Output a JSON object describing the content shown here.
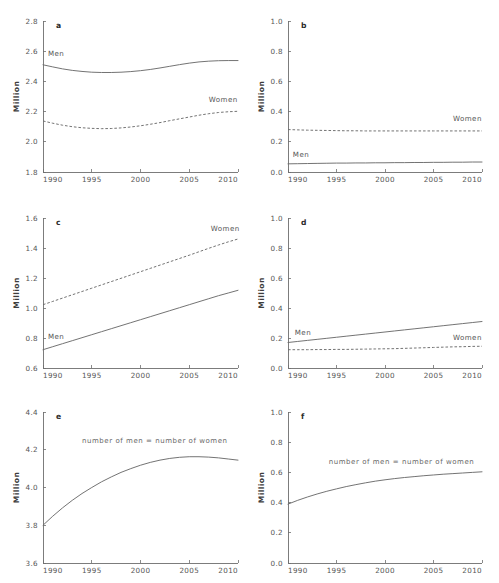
{
  "figure": {
    "width": 499,
    "height": 583,
    "background": "#ffffff",
    "line_color": "#6b6b6b",
    "text_color": "#555555",
    "panel_count": 6,
    "rows": 3,
    "cols": 2
  },
  "common": {
    "ylabel": "Million",
    "xticks": [
      "1990",
      "1995",
      "2000",
      "2005",
      "2010"
    ],
    "xlim": [
      1990,
      2010
    ],
    "men_label": "Men",
    "women_label": "Women",
    "equal_label": "number of men = number of women"
  },
  "chart_data": [
    {
      "type": "line",
      "panel": "a",
      "title": "",
      "xlabel": "",
      "ylabel": "Million",
      "xlim": [
        1990,
        2010
      ],
      "ylim": [
        1.8,
        2.8
      ],
      "yticks": [
        "1.8",
        "2.0",
        "2.2",
        "2.4",
        "2.6",
        "2.8"
      ],
      "ytick_values": [
        1.8,
        2.0,
        2.2,
        2.4,
        2.6,
        2.8
      ],
      "xticks": [
        "1990",
        "1995",
        "2000",
        "2005",
        "2010"
      ],
      "grid": false,
      "legend_position": "inline-annotation",
      "x": [
        1990,
        1991,
        1992,
        1993,
        1994,
        1995,
        1996,
        1997,
        1998,
        1999,
        2000,
        2001,
        2002,
        2003,
        2004,
        2005,
        2006,
        2007,
        2008,
        2009,
        2010
      ],
      "series": [
        {
          "name": "Men",
          "style": "solid",
          "label_x": 1990.5,
          "label_y": 2.57,
          "values": [
            2.51,
            2.496,
            2.483,
            2.473,
            2.466,
            2.461,
            2.459,
            2.459,
            2.461,
            2.465,
            2.471,
            2.479,
            2.489,
            2.5,
            2.511,
            2.521,
            2.529,
            2.534,
            2.537,
            2.538,
            2.538
          ]
        },
        {
          "name": "Women",
          "style": "dashed",
          "label_x": 2007.0,
          "label_y": 2.265,
          "values": [
            2.138,
            2.123,
            2.11,
            2.1,
            2.093,
            2.089,
            2.087,
            2.088,
            2.092,
            2.098,
            2.106,
            2.116,
            2.127,
            2.14,
            2.152,
            2.164,
            2.176,
            2.186,
            2.194,
            2.199,
            2.202
          ]
        }
      ]
    },
    {
      "type": "line",
      "panel": "b",
      "title": "",
      "xlabel": "",
      "ylabel": "Million",
      "xlim": [
        1990,
        2010
      ],
      "ylim": [
        0.0,
        1.0
      ],
      "yticks": [
        "0.0",
        "0.2",
        "0.4",
        "0.6",
        "0.8",
        "1.0"
      ],
      "ytick_values": [
        0.0,
        0.2,
        0.4,
        0.6,
        0.8,
        1.0
      ],
      "xticks": [
        "1990",
        "1995",
        "2000",
        "2005",
        "2010"
      ],
      "grid": false,
      "legend_position": "inline-annotation",
      "x": [
        1990,
        1991,
        1992,
        1993,
        1994,
        1995,
        1996,
        1997,
        1998,
        1999,
        2000,
        2001,
        2002,
        2003,
        2004,
        2005,
        2006,
        2007,
        2008,
        2009,
        2010
      ],
      "series": [
        {
          "name": "Women",
          "style": "dashed",
          "label_x": 2007.0,
          "label_y": 0.335,
          "values": [
            0.281,
            0.279,
            0.277,
            0.276,
            0.275,
            0.274,
            0.273,
            0.273,
            0.272,
            0.272,
            0.272,
            0.272,
            0.272,
            0.272,
            0.272,
            0.272,
            0.272,
            0.272,
            0.272,
            0.272,
            0.272
          ]
        },
        {
          "name": "Men",
          "style": "solid",
          "label_x": 1990.5,
          "label_y": 0.098,
          "values": [
            0.054,
            0.055,
            0.056,
            0.057,
            0.058,
            0.059,
            0.059,
            0.06,
            0.06,
            0.061,
            0.061,
            0.062,
            0.062,
            0.063,
            0.063,
            0.064,
            0.064,
            0.065,
            0.065,
            0.066,
            0.066
          ]
        }
      ]
    },
    {
      "type": "line",
      "panel": "c",
      "title": "",
      "xlabel": "",
      "ylabel": "Million",
      "xlim": [
        1990,
        2010
      ],
      "ylim": [
        0.6,
        1.6
      ],
      "yticks": [
        "0.6",
        "0.8",
        "1.0",
        "1.2",
        "1.4",
        "1.6"
      ],
      "ytick_values": [
        0.6,
        0.8,
        1.0,
        1.2,
        1.4,
        1.6
      ],
      "xticks": [
        "1990",
        "1995",
        "2000",
        "2005",
        "2010"
      ],
      "grid": false,
      "legend_position": "inline-annotation",
      "x": [
        1990,
        1991,
        1992,
        1993,
        1994,
        1995,
        1996,
        1997,
        1998,
        1999,
        2000,
        2001,
        2002,
        2003,
        2004,
        2005,
        2006,
        2007,
        2008,
        2009,
        2010
      ],
      "series": [
        {
          "name": "Women",
          "style": "dashed",
          "label_x": 2007.2,
          "label_y": 1.515,
          "values": [
            1.022,
            1.044,
            1.066,
            1.088,
            1.11,
            1.132,
            1.154,
            1.176,
            1.198,
            1.22,
            1.242,
            1.264,
            1.286,
            1.308,
            1.33,
            1.352,
            1.375,
            1.398,
            1.42,
            1.441,
            1.46
          ]
        },
        {
          "name": "Men",
          "style": "solid",
          "label_x": 1990.5,
          "label_y": 0.795,
          "values": [
            0.722,
            0.742,
            0.762,
            0.782,
            0.802,
            0.822,
            0.842,
            0.862,
            0.882,
            0.902,
            0.922,
            0.942,
            0.962,
            0.982,
            1.002,
            1.022,
            1.042,
            1.062,
            1.082,
            1.1,
            1.118
          ]
        }
      ]
    },
    {
      "type": "line",
      "panel": "d",
      "title": "",
      "xlabel": "",
      "ylabel": "Million",
      "xlim": [
        1990,
        2010
      ],
      "ylim": [
        0.0,
        1.0
      ],
      "yticks": [
        "0.0",
        "0.2",
        "0.4",
        "0.6",
        "0.8",
        "1.0"
      ],
      "ytick_values": [
        0.0,
        0.2,
        0.4,
        0.6,
        0.8,
        1.0
      ],
      "xticks": [
        "1990",
        "1995",
        "2000",
        "2005",
        "2010"
      ],
      "grid": false,
      "legend_position": "inline-annotation",
      "x": [
        1990,
        1991,
        1992,
        1993,
        1994,
        1995,
        1996,
        1997,
        1998,
        1999,
        2000,
        2001,
        2002,
        2003,
        2004,
        2005,
        2006,
        2007,
        2008,
        2009,
        2010
      ],
      "series": [
        {
          "name": "Men",
          "style": "solid",
          "label_x": 1990.7,
          "label_y": 0.222,
          "values": [
            0.17,
            0.177,
            0.184,
            0.191,
            0.198,
            0.205,
            0.212,
            0.219,
            0.226,
            0.233,
            0.24,
            0.247,
            0.254,
            0.261,
            0.268,
            0.275,
            0.282,
            0.289,
            0.296,
            0.303,
            0.31
          ]
        },
        {
          "name": "Women",
          "style": "dashed",
          "label_x": 2007.0,
          "label_y": 0.186,
          "values": [
            0.122,
            0.122,
            0.122,
            0.123,
            0.123,
            0.124,
            0.124,
            0.125,
            0.126,
            0.127,
            0.128,
            0.129,
            0.131,
            0.133,
            0.135,
            0.137,
            0.139,
            0.141,
            0.142,
            0.144,
            0.145
          ]
        }
      ]
    },
    {
      "type": "line",
      "panel": "e",
      "title": "",
      "xlabel": "",
      "ylabel": "Million",
      "xlim": [
        1990,
        2010
      ],
      "ylim": [
        3.6,
        4.4
      ],
      "yticks": [
        "3.6",
        "3.8",
        "4.0",
        "4.2",
        "4.4"
      ],
      "ytick_values": [
        3.6,
        3.8,
        4.0,
        4.2,
        4.4
      ],
      "xticks": [
        "1990",
        "1995",
        "2000",
        "2005",
        "2010"
      ],
      "grid": false,
      "legend_position": "inline-annotation",
      "x": [
        1990,
        1991,
        1992,
        1993,
        1994,
        1995,
        1996,
        1997,
        1998,
        1999,
        2000,
        2001,
        2002,
        2003,
        2004,
        2005,
        2006,
        2007,
        2008,
        2009,
        2010
      ],
      "series": [
        {
          "name": "number of men = number of women",
          "style": "solid",
          "label_x": 1994.0,
          "label_y": 4.235,
          "values": [
            3.8,
            3.848,
            3.892,
            3.932,
            3.968,
            4.0,
            4.03,
            4.056,
            4.08,
            4.1,
            4.118,
            4.133,
            4.145,
            4.154,
            4.16,
            4.163,
            4.163,
            4.161,
            4.157,
            4.151,
            4.145
          ]
        }
      ]
    },
    {
      "type": "line",
      "panel": "f",
      "title": "",
      "xlabel": "",
      "ylabel": "Million",
      "xlim": [
        1990,
        2010
      ],
      "ylim": [
        0.0,
        1.0
      ],
      "yticks": [
        "0.0",
        "0.2",
        "0.4",
        "0.6",
        "0.8",
        "1.0"
      ],
      "ytick_values": [
        0.0,
        0.2,
        0.4,
        0.6,
        0.8,
        1.0
      ],
      "xticks": [
        "1990",
        "1995",
        "2000",
        "2005",
        "2010"
      ],
      "grid": false,
      "legend_position": "inline-annotation",
      "x": [
        1990,
        1991,
        1992,
        1993,
        1994,
        1995,
        1996,
        1997,
        1998,
        1999,
        2000,
        2001,
        2002,
        2003,
        2004,
        2005,
        2006,
        2007,
        2008,
        2009,
        2010
      ],
      "series": [
        {
          "name": "number of men = number of women",
          "style": "solid",
          "label_x": 1994.2,
          "label_y": 0.655,
          "values": [
            0.39,
            0.415,
            0.437,
            0.457,
            0.475,
            0.491,
            0.506,
            0.519,
            0.531,
            0.542,
            0.551,
            0.559,
            0.566,
            0.572,
            0.578,
            0.583,
            0.588,
            0.592,
            0.596,
            0.6,
            0.604
          ]
        }
      ]
    }
  ],
  "panels": [
    {
      "letter": "a",
      "row": 0,
      "col": 0
    },
    {
      "letter": "b",
      "row": 0,
      "col": 1
    },
    {
      "letter": "c",
      "row": 1,
      "col": 0
    },
    {
      "letter": "d",
      "row": 1,
      "col": 1
    },
    {
      "letter": "e",
      "row": 2,
      "col": 0
    },
    {
      "letter": "f",
      "row": 2,
      "col": 1
    }
  ]
}
